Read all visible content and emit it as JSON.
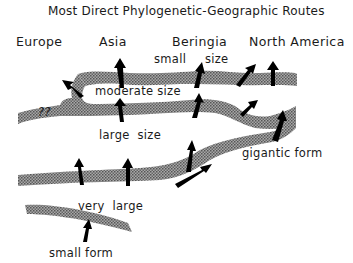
{
  "title": "Most Direct Phylogenetic-Geographic Routes",
  "regions": [
    "Europe",
    "Asia",
    "Beringia",
    "North America"
  ],
  "labels": {
    "small_size_1": "small",
    "small_size_2": "size",
    "moderate_size": "moderate  size",
    "large_size": "large  size",
    "gigantic_form": "gigantic form",
    "very_large": "very  large",
    "small_form": "small form",
    "unknown_origin": "??"
  },
  "colors": {
    "band": "#8a8a8a",
    "arrow": "#000000",
    "text": "#1a1a1a"
  }
}
